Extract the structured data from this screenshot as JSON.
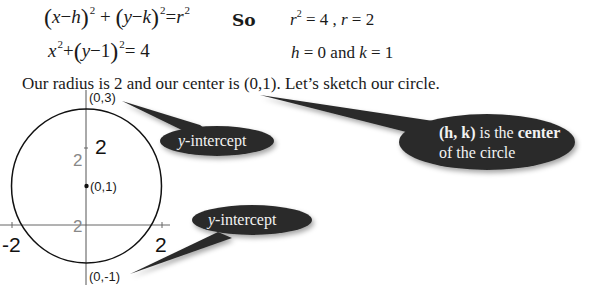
{
  "equations": {
    "standard_form": {
      "x": "x",
      "h": "h",
      "y": "y",
      "k": "k",
      "r": "r",
      "exp": "2",
      "minus": "−",
      "plus": "+",
      "eq": "=",
      "lp": "(",
      "rp": ")"
    },
    "specific_form": {
      "x": "x",
      "exp": "2",
      "plus": "+",
      "lp": "(",
      "y": "y",
      "minus": "−",
      "one": "1",
      "rp": ")",
      "eq": "= 4"
    },
    "so_label": "So",
    "radius_line": {
      "r": "r",
      "exp": "2",
      "rest": " = 4 , ",
      "r2": "r",
      "eq2": " = 2"
    },
    "center_line": {
      "h": "h",
      "mid": " = 0 and ",
      "k": "k",
      "end": " = 1"
    }
  },
  "sentence": "Our radius is 2 and our center is (0,1).  Let’s sketch our circle.",
  "graph": {
    "points": {
      "top": "(0,3)",
      "center": "(0,1)",
      "bottom": "(0,-1)"
    },
    "radius_labels": {
      "vertical": "2",
      "right": "2"
    },
    "gray_labels": {
      "upper": "2",
      "lower": "2"
    },
    "axis_labels": {
      "left": "-2",
      "right": "2"
    }
  },
  "callouts": {
    "top_intercept": {
      "italic": "y",
      "rest": "-intercept"
    },
    "bottom_intercept": {
      "italic": "y",
      "rest": "-intercept"
    },
    "center": {
      "line1_bold": "(h, k)",
      "line1_mid": " is the ",
      "line1_bold2": "center",
      "line2": "of the circle"
    }
  },
  "colors": {
    "bubble": "#2b2b2b",
    "ink": "#1a1a1a",
    "gray_label": "#888888"
  }
}
